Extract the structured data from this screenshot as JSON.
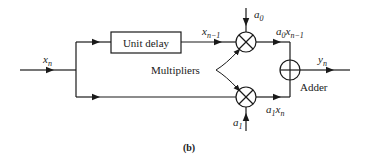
{
  "diagram": {
    "input_label": "x",
    "input_sub": "n",
    "delay_block": "Unit delay",
    "delayed_label": "x",
    "delayed_sub": "n−1",
    "coef_top": "a",
    "coef_top_sub": "0",
    "coef_bottom": "a",
    "coef_bottom_sub": "1",
    "product_top": {
      "a": "a",
      "a_sub": "0",
      "x": "x",
      "x_sub": "n−1"
    },
    "product_bottom": {
      "a": "a",
      "a_sub": "1",
      "x": "x",
      "x_sub": "n"
    },
    "multipliers_label": "Multipliers",
    "adder_label": "Adder",
    "output_label": "y",
    "output_sub": "n",
    "caption": "(b)"
  },
  "colors": {
    "stroke": "#1a1a1a",
    "background": "#ffffff"
  }
}
